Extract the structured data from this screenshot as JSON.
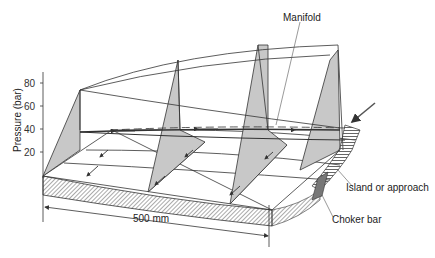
{
  "diagram": {
    "y_axis": {
      "label": "Pressure (bar)",
      "ticks": [
        "80",
        "60",
        "40",
        "20"
      ]
    },
    "labels": {
      "manifold": "Manifold",
      "island": "Island or approach",
      "choker": "Choker bar",
      "dimension": "500 mm"
    },
    "colors": {
      "line": "#333333",
      "fill": "#c8c8c8",
      "hatch": "#555555"
    }
  }
}
